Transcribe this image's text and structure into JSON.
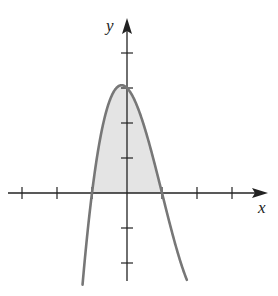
{
  "chart_data": {
    "type": "line",
    "title": "",
    "xlabel": "x",
    "ylabel": "y",
    "function": "y = (1 - x^2)(3 - x)",
    "shaded_region": {
      "from_x": -1,
      "to_x": 1,
      "between": "curve and x-axis",
      "fill": "#e4e4e4"
    },
    "x_ticks": [
      -3,
      -2,
      -1,
      1,
      2,
      3
    ],
    "y_ticks": [
      -2,
      -1,
      1,
      2,
      3,
      4
    ],
    "xlim": [
      -3.5,
      4.0
    ],
    "ylim": [
      -2.5,
      4.5
    ],
    "roots": [
      -1,
      1
    ],
    "local_max": {
      "x": -0.25,
      "y": 3.05
    },
    "curve_color": "#777777",
    "axis_color": "#222222",
    "grid": false,
    "legend": null
  },
  "labels": {
    "x_axis": "x",
    "y_axis": "y"
  }
}
